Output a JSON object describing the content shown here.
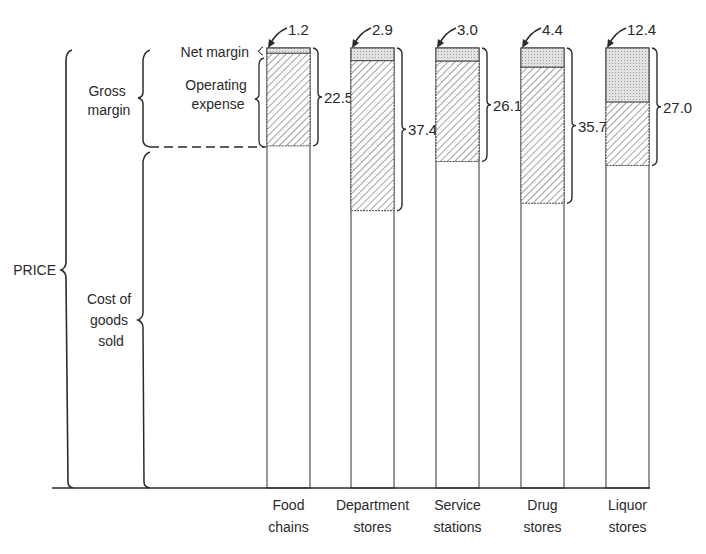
{
  "chart_data": {
    "type": "bar",
    "subtype": "stacked-price-composition",
    "title": "",
    "xlabel": "",
    "ylabel": "PRICE",
    "categories": [
      "Food chains",
      "Department stores",
      "Service stations",
      "Drug stores",
      "Liquor stores"
    ],
    "category_lines": [
      [
        "Food",
        "chains"
      ],
      [
        "Department",
        "stores"
      ],
      [
        "Service",
        "stations"
      ],
      [
        "Drug",
        "stores"
      ],
      [
        "Liquor",
        "stores"
      ]
    ],
    "series": [
      {
        "name": "Net margin",
        "values": [
          1.2,
          2.9,
          3.0,
          4.4,
          12.4
        ]
      },
      {
        "name": "Operating expense",
        "values": [
          21.3,
          34.5,
          23.1,
          31.3,
          14.6
        ]
      },
      {
        "name": "Gross margin",
        "values": [
          22.5,
          37.4,
          26.1,
          35.7,
          27.0
        ]
      },
      {
        "name": "Cost of goods sold",
        "values": [
          77.5,
          62.6,
          73.9,
          64.3,
          73.0
        ]
      }
    ],
    "net_margin_labels": [
      "1.2",
      "2.9",
      "3.0",
      "4.4",
      "12.4"
    ],
    "gross_margin_labels": [
      "22.5",
      "37.4",
      "26.1",
      "35.7",
      "27.0"
    ],
    "units": "percent of price",
    "ylim": [
      0,
      100
    ],
    "grid": false,
    "legend": "brace annotations on left"
  },
  "annotations": {
    "price": "PRICE",
    "gross_margin": [
      "Gross",
      "margin"
    ],
    "net_margin": "Net margin",
    "operating_expense": [
      "Operating",
      "expense"
    ],
    "cost_of_goods": [
      "Cost of",
      "goods",
      "sold"
    ]
  },
  "colors": {
    "ink": "#2a2a2a",
    "net_margin_fill": "#d9d9d9",
    "hatch": "#555555",
    "background": "#ffffff"
  }
}
